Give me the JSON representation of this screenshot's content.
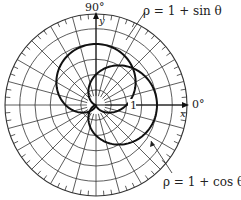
{
  "chart_data": {
    "type": "line",
    "subtype": "polar",
    "title": "",
    "center_px": [
      96,
      105
    ],
    "unit_px": 30.5,
    "outer_radius_px": 91,
    "grid": {
      "rings": 6,
      "ring_step": 0.5,
      "radial_step_deg": 15,
      "rim_tick_step_deg": 5
    },
    "axes": {
      "x_label": "x",
      "y_label": "y",
      "angle_0_label": "0°",
      "angle_90_label": "90°",
      "radius_tick_label": "1"
    },
    "series": [
      {
        "name": "ρ = 1 + sin θ",
        "equation": "1+sin(theta)",
        "max_rho": 2,
        "max_at_deg": 90
      },
      {
        "name": "ρ = 1 + cos θ",
        "equation": "1+cos(theta)",
        "max_rho": 2,
        "max_at_deg": 0
      }
    ],
    "annotations": [
      {
        "text": "ρ = 1 + sin θ",
        "position": "upper-right",
        "leader": true
      },
      {
        "text": "ρ = 1 + cos θ",
        "position": "lower-right",
        "leader": true
      }
    ]
  },
  "labels": {
    "deg90": "90°",
    "deg0": "0°",
    "y": "y",
    "x": "x",
    "one": "1",
    "sinCurve": "ρ = 1 + sin θ",
    "cosCurve": "ρ = 1 + cos θ"
  }
}
